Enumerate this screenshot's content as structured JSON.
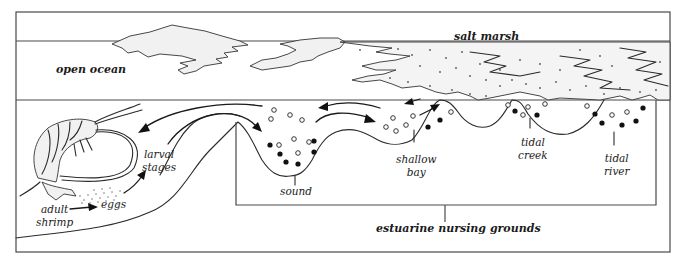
{
  "diagram": {
    "labels": {
      "open_ocean": "open ocean",
      "salt_marsh": "salt marsh",
      "larval_stages_line1": "larval",
      "larval_stages_line2": "stages",
      "adult_shrimp_line1": "adult",
      "adult_shrimp_line2": "shrimp",
      "eggs": "eggs",
      "sound": "sound",
      "shallow_bay_line1": "shallow",
      "shallow_bay_line2": "bay",
      "tidal_creek_line1": "tidal",
      "tidal_creek_line2": "creek",
      "tidal_river_line1": "tidal",
      "tidal_river_line2": "river",
      "estuarine_nursing_grounds": "estuarine nursing grounds"
    },
    "nodes": [
      {
        "id": "adult_shrimp",
        "label": "adult shrimp"
      },
      {
        "id": "eggs",
        "label": "eggs"
      },
      {
        "id": "larval_stages",
        "label": "larval stages"
      },
      {
        "id": "sound",
        "label": "sound",
        "group": "estuarine nursing grounds"
      },
      {
        "id": "shallow_bay",
        "label": "shallow bay",
        "group": "estuarine nursing grounds"
      },
      {
        "id": "tidal_creek",
        "label": "tidal creek",
        "group": "estuarine nursing grounds"
      },
      {
        "id": "tidal_river",
        "label": "tidal river",
        "group": "estuarine nursing grounds"
      }
    ],
    "edges": [
      {
        "from": "adult_shrimp",
        "to": "eggs"
      },
      {
        "from": "eggs",
        "to": "larval_stages"
      },
      {
        "from": "larval_stages",
        "to": "sound"
      },
      {
        "from": "sound",
        "to": "shallow_bay"
      },
      {
        "from": "shallow_bay",
        "to": "sound"
      },
      {
        "from": "shallow_bay",
        "to": "salt_marsh"
      },
      {
        "from": "salt_marsh",
        "to": "shallow_bay"
      },
      {
        "from": "sound",
        "to": "open_ocean"
      }
    ],
    "regions": [
      "open ocean",
      "salt marsh",
      "estuarine nursing grounds"
    ],
    "legend_markers": {
      "open_circle": "larvae / juveniles (open circles)",
      "filled_circle": "juveniles (filled circles)"
    },
    "colors": {
      "ink": "#1a1a1a",
      "frame": "#4a4a4a",
      "background": "#ffffff"
    }
  }
}
